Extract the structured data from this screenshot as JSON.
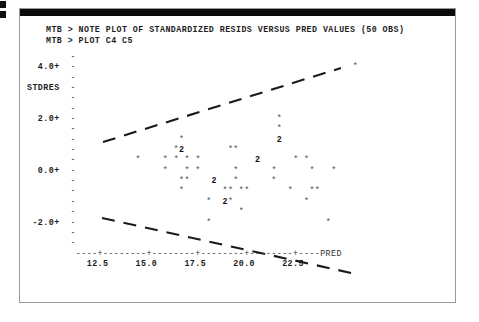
{
  "window": {
    "title": "Minitab session output — residual plot",
    "frame_color": "#9a9a9a",
    "ink_color": "#2a2a2a"
  },
  "terminal": {
    "prompt": "MTB >",
    "lines": [
      "MTB > NOTE PLOT OF STANDARDIZED RESIDS VERSUS PRED VALUES (50 OBS)",
      "MTB > PLOT C4 C5"
    ],
    "command_1": "MTB > NOTE PLOT OF STANDARDIZED RESIDS VERSUS PRED VALUES (50 OBS)",
    "command_2": "MTB > PLOT C4 C5"
  },
  "chart_data": {
    "type": "scatter",
    "title": "PLOT OF STANDARDIZED RESIDS VERSUS PRED VALUES (50 OBS)",
    "xlabel": "PRED",
    "ylabel": "STDRES",
    "grid": false,
    "legend": null,
    "xlim": [
      11.0,
      23.8
    ],
    "ylim": [
      -3.0,
      4.6
    ],
    "xticks": [
      "12.5",
      "15.0",
      "17.5",
      "20.0",
      "22.5"
    ],
    "xtick_values": [
      12.5,
      15.0,
      17.5,
      20.0,
      22.5
    ],
    "yticks": [
      "4.0+",
      "2.0+",
      "0.0+",
      "-2.0+"
    ],
    "ytick_values": [
      4.0,
      2.0,
      0.0,
      -2.0
    ],
    "axis_tick_mark": "+",
    "axis_fill_char": "-",
    "point_marker": "*",
    "overplot_marker_note": "digit 2 marks two coincident observations",
    "n_obs": 50,
    "annotations": [
      {
        "text": "upper dashed envelope line, rises left-to-right from about (11.4,1.25) to (22.0,4.05)"
      },
      {
        "text": "lower dashed envelope line, falls left-to-right from about (11.3,-1.05) to (22.6,-2.95)"
      }
    ],
    "ascii_rows": [
      {
        "y_label": "     ",
        "cells": ""
      },
      {
        "y_label": " 4.0+",
        "cells": "                                                 *"
      },
      {
        "y_label": "     ",
        "cells": ""
      },
      {
        "y_label": "STDRES",
        "cells": ""
      },
      {
        "y_label": "     ",
        "cells": ""
      },
      {
        "y_label": "     ",
        "cells": ""
      },
      {
        "y_label": " 2.0+",
        "cells": "                                   *"
      },
      {
        "y_label": "     ",
        "cells": "                                   *"
      },
      {
        "y_label": "     ",
        "cells": "                 *                 2"
      },
      {
        "y_label": "     ",
        "cells": "                *2        **"
      },
      {
        "y_label": "     ",
        "cells": "         *    * * * *          2      * *"
      },
      {
        "y_label": " 0.0+",
        "cells": "              *   * *      *      *      *   *"
      },
      {
        "y_label": "     ",
        "cells": "                 **    2   *      *"
      },
      {
        "y_label": "     ",
        "cells": "                 *       ** **       *   **"
      },
      {
        "y_label": "     ",
        "cells": "                      *  2*             *"
      },
      {
        "y_label": "     ",
        "cells": "                            *"
      },
      {
        "y_label": "-2.0+",
        "cells": "                      *                     *"
      },
      {
        "y_label": "     ",
        "cells": ""
      },
      {
        "y_label": "     ",
        "cells": ""
      }
    ],
    "points": [
      {
        "x": 22.0,
        "y": 4.0,
        "count": 1
      },
      {
        "x": 18.4,
        "y": 2.1,
        "count": 1
      },
      {
        "x": 18.4,
        "y": 1.75,
        "count": 1
      },
      {
        "x": 18.6,
        "y": 1.45,
        "count": 2
      },
      {
        "x": 14.7,
        "y": 1.45,
        "count": 1
      },
      {
        "x": 17.4,
        "y": 1.45,
        "count": 1
      },
      {
        "x": 14.6,
        "y": 1.1,
        "count": 1
      },
      {
        "x": 14.9,
        "y": 1.1,
        "count": 2
      },
      {
        "x": 16.6,
        "y": 1.1,
        "count": 1
      },
      {
        "x": 16.9,
        "y": 1.1,
        "count": 1
      },
      {
        "x": 12.4,
        "y": 0.75,
        "count": 1
      },
      {
        "x": 13.6,
        "y": 0.75,
        "count": 1
      },
      {
        "x": 14.0,
        "y": 0.75,
        "count": 1
      },
      {
        "x": 14.4,
        "y": 0.75,
        "count": 1
      },
      {
        "x": 14.8,
        "y": 0.75,
        "count": 1
      },
      {
        "x": 17.6,
        "y": 0.75,
        "count": 2
      },
      {
        "x": 19.0,
        "y": 0.75,
        "count": 1
      },
      {
        "x": 19.4,
        "y": 0.75,
        "count": 1
      },
      {
        "x": 13.6,
        "y": 0.05,
        "count": 1
      },
      {
        "x": 14.5,
        "y": 0.05,
        "count": 1
      },
      {
        "x": 14.9,
        "y": 0.05,
        "count": 1
      },
      {
        "x": 16.4,
        "y": 0.05,
        "count": 1
      },
      {
        "x": 17.5,
        "y": 0.05,
        "count": 1
      },
      {
        "x": 19.2,
        "y": 0.05,
        "count": 1
      },
      {
        "x": 20.0,
        "y": 0.05,
        "count": 1
      },
      {
        "x": 14.6,
        "y": -0.35,
        "count": 1
      },
      {
        "x": 14.9,
        "y": -0.35,
        "count": 1
      },
      {
        "x": 16.0,
        "y": -0.35,
        "count": 2
      },
      {
        "x": 17.3,
        "y": -0.35,
        "count": 1
      },
      {
        "x": 18.3,
        "y": -0.35,
        "count": 1
      },
      {
        "x": 14.6,
        "y": -0.75,
        "count": 1
      },
      {
        "x": 16.5,
        "y": -0.75,
        "count": 1
      },
      {
        "x": 16.8,
        "y": -0.75,
        "count": 1
      },
      {
        "x": 17.4,
        "y": -0.75,
        "count": 1
      },
      {
        "x": 17.7,
        "y": -0.75,
        "count": 1
      },
      {
        "x": 19.2,
        "y": -0.75,
        "count": 1
      },
      {
        "x": 19.9,
        "y": -0.75,
        "count": 1
      },
      {
        "x": 20.2,
        "y": -0.75,
        "count": 1
      },
      {
        "x": 15.9,
        "y": -1.1,
        "count": 1
      },
      {
        "x": 17.2,
        "y": -1.1,
        "count": 2
      },
      {
        "x": 17.5,
        "y": -1.1,
        "count": 1
      },
      {
        "x": 19.6,
        "y": -1.1,
        "count": 1
      },
      {
        "x": 18.3,
        "y": -1.5,
        "count": 1
      },
      {
        "x": 16.6,
        "y": -2.0,
        "count": 1
      },
      {
        "x": 21.2,
        "y": -2.0,
        "count": 1
      }
    ]
  }
}
